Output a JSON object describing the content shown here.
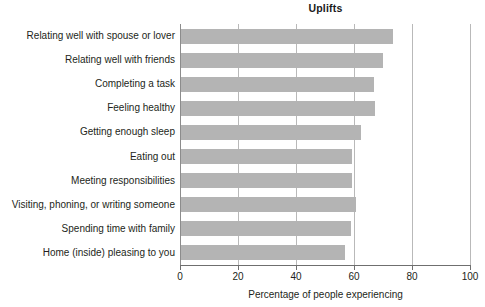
{
  "chart_data": {
    "type": "bar",
    "orientation": "horizontal",
    "title": "Uplifts",
    "xlabel": "Percentage of people experiencing",
    "ylabel": "",
    "xlim": [
      0,
      100
    ],
    "xticks": [
      0,
      20,
      40,
      60,
      80,
      100
    ],
    "xtick_labels": [
      "0",
      "20",
      "40",
      "60",
      "80",
      "100"
    ],
    "grid": true,
    "grid_axis": "x",
    "legend": "none",
    "bar_color": "#b4b4b4",
    "categories": [
      "Relating well with spouse or lover",
      "Relating well with friends",
      "Completing a task",
      "Feeling healthy",
      "Getting enough sleep",
      "Eating out",
      "Meeting responsibilities",
      "Visiting, phoning, or writing someone",
      "Spending time with family",
      "Home (inside) pleasing to you"
    ],
    "values": [
      73,
      69.5,
      66.5,
      67,
      62,
      59,
      59,
      60.5,
      58.5,
      56.5
    ]
  }
}
